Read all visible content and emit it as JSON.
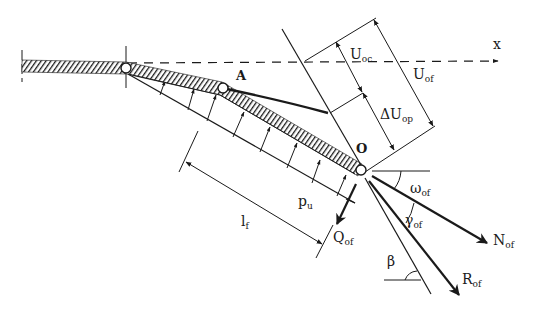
{
  "diagram": {
    "type": "structural-mechanics",
    "colors": {
      "ink": "#1a1a1a",
      "background": "#ffffff"
    },
    "axis": {
      "label": "x",
      "style": "dashed"
    },
    "points": {
      "A": "A",
      "O": "O"
    },
    "labels": {
      "U_oc": {
        "main": "U",
        "sub": "oc"
      },
      "U_of": {
        "main": "U",
        "sub": "of"
      },
      "dU_op": {
        "main": "ΔU",
        "sub": "op"
      },
      "p_u": {
        "main": "p",
        "sub": "u"
      },
      "l_f": {
        "main": "l",
        "sub": "f"
      },
      "Q_of": {
        "main": "Q",
        "sub": "of"
      },
      "omega_of": {
        "main": "ω",
        "sub": "of"
      },
      "gamma_of": {
        "main": "γ",
        "sub": "of"
      },
      "N_of": {
        "main": "N",
        "sub": "of"
      },
      "R_of": {
        "main": "R",
        "sub": "of"
      },
      "beta": {
        "main": "β"
      }
    }
  }
}
